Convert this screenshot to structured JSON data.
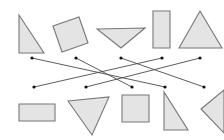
{
  "diagram": {
    "type": "matching-lines",
    "colors": {
      "fill": "#e4e4e4",
      "stroke": "#777777",
      "line": "#4a4a4a",
      "dot": "#111111"
    },
    "top_shapes": [
      {
        "name": "right-triangle",
        "points": "19,15 19,53 44,53"
      },
      {
        "name": "rotated-square",
        "points": "53,26 79,17 88,43 62,52"
      },
      {
        "name": "inverted-triangle",
        "points": "97,29 145,28 121,48"
      },
      {
        "name": "tall-rectangle",
        "points": "153,11 170,11 170,48 153,48"
      },
      {
        "name": "isosceles-triangle",
        "points": "200,11 222,48 179,48"
      }
    ],
    "bottom_shapes": [
      {
        "name": "wide-rectangle",
        "points": "19,104 55,104 55,121 19,121"
      },
      {
        "name": "down-triangle",
        "points": "68,101 109,97 92,135"
      },
      {
        "name": "square",
        "points": "122,95 149,95 149,122 122,122"
      },
      {
        "name": "right-triangle",
        "points": "164,92 164,130 188,130"
      },
      {
        "name": "left-pointing-triangle",
        "points": "201,109 224,90 224,133"
      }
    ],
    "top_dots": [
      [
        32,
        58
      ],
      [
        76,
        58
      ],
      [
        121,
        58
      ],
      [
        162,
        58
      ],
      [
        200,
        58
      ]
    ],
    "bottom_dots": [
      [
        34,
        87
      ],
      [
        86,
        87
      ],
      [
        132,
        87
      ],
      [
        165,
        87
      ],
      [
        204,
        87
      ]
    ],
    "connections": [
      {
        "from_top": 1,
        "to_bottom": 4
      },
      {
        "from_top": 2,
        "to_bottom": 3
      },
      {
        "from_top": 3,
        "to_bottom": 5
      },
      {
        "from_top": 4,
        "to_bottom": 1
      },
      {
        "from_top": 5,
        "to_bottom": 2
      }
    ]
  }
}
